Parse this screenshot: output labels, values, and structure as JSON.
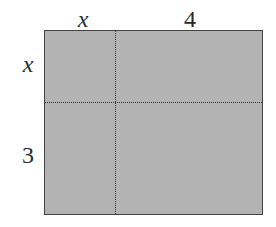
{
  "diagram": {
    "type": "area-model-rectangle",
    "top_labels": [
      "x",
      "4"
    ],
    "left_labels": [
      "x",
      "3"
    ],
    "colors": {
      "fill": "#b3b3b3",
      "border": "#444444",
      "dashed_lines": "#333333",
      "label_text": "#2a2a2a"
    }
  }
}
